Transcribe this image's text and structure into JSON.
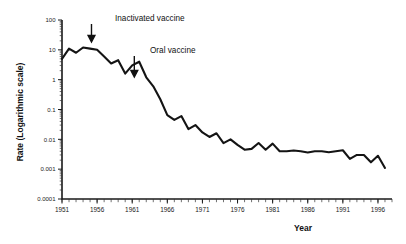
{
  "figure": {
    "background_color": "#ffffff",
    "line_color": "#141414"
  },
  "chart_data": {
    "type": "line",
    "title": "",
    "xlabel": "Year",
    "ylabel": "Rate (Logarithmic scale)",
    "yscale": "log",
    "ylim": [
      0.0001,
      100
    ],
    "xlim": [
      1951,
      1998
    ],
    "grid": false,
    "legend": null,
    "ytick_labels": [
      "100",
      "10",
      "1",
      "0.1",
      "0.01",
      "0.001",
      "0.0001"
    ],
    "ytick_values": [
      100,
      10,
      1,
      0.1,
      0.01,
      0.001,
      0.0001
    ],
    "xtick_labels": [
      "1951",
      "1956",
      "1961",
      "1966",
      "1971",
      "1976",
      "1981",
      "1986",
      "1991",
      "1996"
    ],
    "xtick_values": [
      1951,
      1956,
      1961,
      1966,
      1971,
      1976,
      1981,
      1986,
      1991,
      1996
    ],
    "xtick_minor_step": 1,
    "series": [
      {
        "name": "Poliomyelitis rate",
        "x": [
          1951,
          1952,
          1953,
          1954,
          1955,
          1956,
          1957,
          1958,
          1959,
          1960,
          1961,
          1962,
          1963,
          1964,
          1965,
          1966,
          1967,
          1968,
          1969,
          1970,
          1971,
          1972,
          1973,
          1974,
          1975,
          1976,
          1977,
          1978,
          1979,
          1980,
          1981,
          1982,
          1983,
          1984,
          1985,
          1986,
          1987,
          1988,
          1989,
          1990,
          1991,
          1992,
          1993,
          1994,
          1995,
          1996,
          1997
        ],
        "y": [
          5.0,
          11.0,
          8.0,
          12.0,
          11.0,
          10.0,
          6.0,
          3.5,
          4.5,
          1.6,
          3.0,
          4.0,
          1.2,
          0.6,
          0.22,
          0.065,
          0.045,
          0.06,
          0.022,
          0.03,
          0.017,
          0.012,
          0.016,
          0.0075,
          0.01,
          0.0065,
          0.0045,
          0.0048,
          0.0075,
          0.0045,
          0.0072,
          0.004,
          0.004,
          0.0042,
          0.004,
          0.0036,
          0.004,
          0.004,
          0.0037,
          0.004,
          0.0043,
          0.0022,
          0.003,
          0.003,
          0.0017,
          0.0028,
          0.0011
        ]
      }
    ],
    "annotations": [
      {
        "label": "Inactivated vaccine",
        "x": 1955,
        "pointer": "down-arrow"
      },
      {
        "label": "Oral vaccine",
        "x": 1961,
        "pointer": "down-arrow"
      }
    ]
  }
}
